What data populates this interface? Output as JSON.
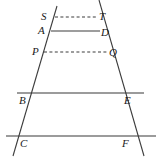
{
  "figure": {
    "type": "geometry-diagram",
    "width": 156,
    "height": 161,
    "background_color": "#ffffff",
    "stroke_color_dark": "#3c3c3c",
    "stroke_color_gray": "#7a7a7a",
    "label_color": "#1a1a1a",
    "labels": [
      {
        "id": "S",
        "text": "S",
        "x": 41,
        "y": 11
      },
      {
        "id": "T",
        "text": "T",
        "x": 99,
        "y": 11
      },
      {
        "id": "A",
        "text": "A",
        "x": 38,
        "y": 25
      },
      {
        "id": "D",
        "text": "D",
        "x": 101,
        "y": 27
      },
      {
        "id": "P",
        "text": "P",
        "x": 32,
        "y": 46
      },
      {
        "id": "Q",
        "text": "Q",
        "x": 109,
        "y": 47
      },
      {
        "id": "B",
        "text": "B",
        "x": 19,
        "y": 95
      },
      {
        "id": "E",
        "text": "E",
        "x": 124,
        "y": 95
      },
      {
        "id": "C",
        "text": "C",
        "x": 20,
        "y": 138
      },
      {
        "id": "F",
        "text": "F",
        "x": 122,
        "y": 138
      }
    ],
    "transversals": [
      {
        "id": "left-transversal",
        "x1": 57,
        "y1": 6,
        "x2": 13,
        "y2": 156,
        "color": "#3c3c3c",
        "width": 1.1
      },
      {
        "id": "right-transversal",
        "x1": 99,
        "y1": 0,
        "x2": 144,
        "y2": 156,
        "color": "#3c3c3c",
        "width": 1.1
      }
    ],
    "parallels": [
      {
        "id": "segment-ST",
        "x1": 55,
        "y1": 17,
        "x2": 98,
        "y2": 17,
        "color": "#3c3c3c",
        "width": 1.1,
        "dashed": true,
        "dash": "3 2.4"
      },
      {
        "id": "segment-AD",
        "x1": 51,
        "y1": 31,
        "x2": 100,
        "y2": 31,
        "color": "#3c3c3c",
        "width": 1.1,
        "dashed": false,
        "dash": ""
      },
      {
        "id": "segment-PQ",
        "x1": 44,
        "y1": 52,
        "x2": 108,
        "y2": 52,
        "color": "#3c3c3c",
        "width": 1.1,
        "dashed": true,
        "dash": "3 2.4"
      },
      {
        "id": "line-BE",
        "x1": 17,
        "y1": 93,
        "x2": 144,
        "y2": 93,
        "color": "#7a7a7a",
        "width": 1.4,
        "dashed": false,
        "dash": ""
      },
      {
        "id": "line-CF",
        "x1": 6,
        "y1": 136,
        "x2": 156,
        "y2": 136,
        "color": "#7a7a7a",
        "width": 1.4,
        "dashed": false,
        "dash": ""
      }
    ]
  }
}
